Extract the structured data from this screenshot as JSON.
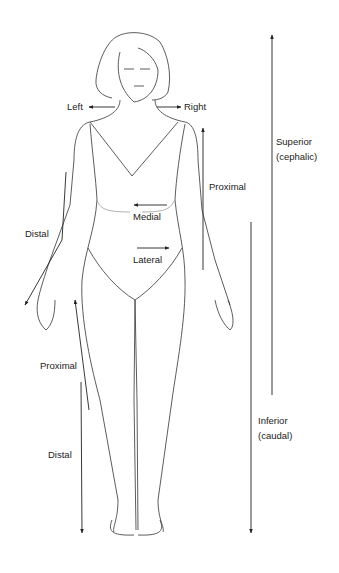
{
  "diagram": {
    "labels": {
      "left": "Left",
      "right": "Right",
      "superior": "Superior",
      "superior_alt": "(cephalic)",
      "inferior": "Inferior",
      "inferior_alt": "(caudal)",
      "proximal_arm": "Proximal",
      "distal_arm": "Distal",
      "medial": "Medial",
      "lateral": "Lateral",
      "proximal_leg": "Proximal",
      "distal_leg": "Distal"
    },
    "colors": {
      "line": "#222222",
      "background": "#ffffff"
    }
  }
}
